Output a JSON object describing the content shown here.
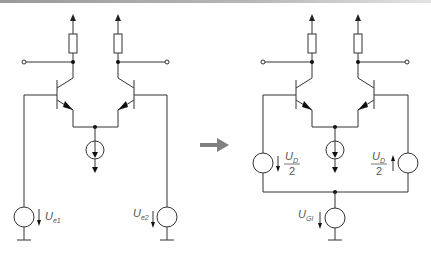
{
  "figure": {
    "colors": {
      "wire": "#333333",
      "label": "#555555",
      "transform_arrow": "#808080",
      "top_bar": "#a0a0a0"
    }
  },
  "left_circuit": {
    "name": "differential pair with separate input sources",
    "sources": [
      {
        "id": "Ue1",
        "label_main": "U",
        "label_sub": "e1",
        "arrow": "down"
      },
      {
        "id": "Ue2",
        "label_main": "U",
        "label_sub": "e2",
        "arrow": "down"
      }
    ],
    "components": [
      "two NPN transistors",
      "two collector resistors",
      "tail current source",
      "two output terminals",
      "two grounds"
    ]
  },
  "transform_arrow": {
    "direction": "right"
  },
  "right_circuit": {
    "name": "differential pair with differential and common-mode sources",
    "sources": [
      {
        "id": "UD_left",
        "label_main": "U",
        "label_sub": "D",
        "denominator": "2",
        "arrow": "down"
      },
      {
        "id": "UD_right",
        "label_main": "U",
        "label_sub": "D",
        "denominator": "2",
        "arrow": "up"
      },
      {
        "id": "UGl",
        "label_main": "U",
        "label_sub": "Gl",
        "arrow": "down"
      }
    ],
    "components": [
      "two NPN transistors",
      "two collector resistors",
      "tail current source",
      "two output terminals",
      "ground"
    ]
  }
}
